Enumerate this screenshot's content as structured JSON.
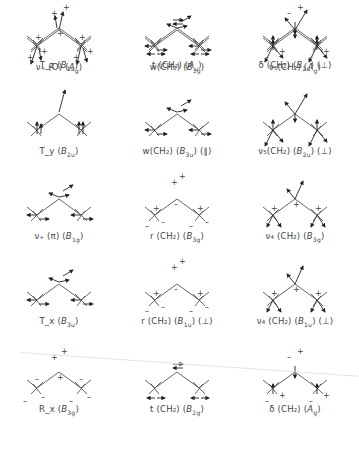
{
  "figure": {
    "rows": 5,
    "cols": 3,
    "modes": [
      {
        "label": "ν₊(O) (A_g)",
        "main": "ν₊ (O)",
        "sym": "A",
        "sub": "g",
        "extra": "",
        "type": "arrows-down"
      },
      {
        "label": "w(CH₂) (B₁g)",
        "main": "w(CH₂)",
        "sym": "B",
        "sub": "1g",
        "extra": "",
        "type": "arrows-side"
      },
      {
        "label": "ν₅(CH₂) (A_g)",
        "main": "ν₅(CH₂)",
        "sym": "A",
        "sub": "g",
        "extra": "",
        "type": "arrows-stretch"
      },
      {
        "label": "T_y (B₂u)",
        "main": "T_y",
        "sym": "B",
        "sub": "2u",
        "extra": "",
        "type": "arrows-up"
      },
      {
        "label": "w(CH₂) (B₃u) (∥)",
        "main": "w(CH₂)",
        "sym": "B",
        "sub": "3u",
        "extra": "(∥)",
        "type": "arrows-side"
      },
      {
        "label": "ν₅(CH₂) (B₂u) (⊥)",
        "main": "ν₅(CH₂)",
        "sym": "B",
        "sub": "2u",
        "extra": "(⊥)",
        "type": "arrows-stretch"
      },
      {
        "label": "ν₊(π) (B₁g)",
        "main": "ν₊ (π)",
        "sym": "B",
        "sub": "1g",
        "extra": "",
        "type": "arrows-side"
      },
      {
        "label": "r(CH₂) (B₃g)",
        "main": "r (CH₂)",
        "sym": "B",
        "sub": "3g",
        "extra": "",
        "type": "signs-rock"
      },
      {
        "label": "ν₄(CH₂) (B₃g)",
        "main": "ν₄ (CH₂)",
        "sym": "B",
        "sub": "3g",
        "extra": "",
        "type": "signs-stretch"
      },
      {
        "label": "T_x (B₃u)",
        "main": "T_x",
        "sym": "B",
        "sub": "3u",
        "extra": "",
        "type": "arrows-side"
      },
      {
        "label": "r(CH₂) (B₁u) (⊥)",
        "main": "r (CH₂)",
        "sym": "B",
        "sub": "1u",
        "extra": "(⊥)",
        "type": "signs-rock"
      },
      {
        "label": "ν₄(CH₂) (B₁u) (⊥)",
        "main": "ν₄ (CH₂)",
        "sym": "B",
        "sub": "1u",
        "extra": "(⊥)",
        "type": "signs-stretch"
      },
      {
        "label": "R_x (B₃g)",
        "main": "R_x",
        "sym": "B",
        "sub": "3g",
        "extra": "",
        "type": "signs-rot"
      },
      {
        "label": "t(CH₂) (B₂g)",
        "main": "t (CH₂)",
        "sym": "B",
        "sub": "2g",
        "extra": "",
        "type": "arrows-twist"
      },
      {
        "label": "δ(CH₂) (A_g)",
        "main": "δ (CH₂)",
        "sym": "A",
        "sub": "g",
        "extra": "",
        "type": "signs-bend"
      },
      {
        "label": "T_z (B₁u)",
        "main": "T_z",
        "sym": "B",
        "sub": "1u",
        "extra": "",
        "type": "signs-all"
      },
      {
        "label": "t(CH₂) (A_u)",
        "main": "t (CH₂)",
        "sym": "A",
        "sub": "u",
        "extra": "",
        "type": "arrows-twist"
      },
      {
        "label": "δ(CH₂) (B₂u) (⊥)",
        "main": "δ (CH₂)",
        "sym": "B",
        "sub": "2u",
        "extra": "(⊥)",
        "type": "signs-bend"
      }
    ]
  }
}
